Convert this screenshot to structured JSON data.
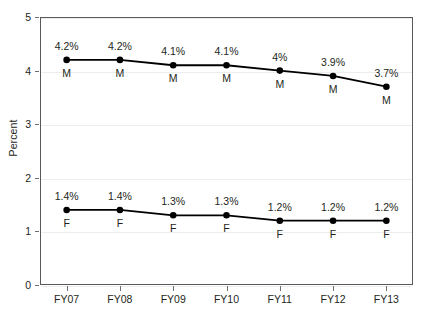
{
  "chart_data": {
    "type": "line",
    "title": "",
    "xlabel": "",
    "ylabel": "Percent",
    "categories": [
      "FY07",
      "FY08",
      "FY09",
      "FY10",
      "FY11",
      "FY12",
      "FY13"
    ],
    "ylim": [
      0,
      5
    ],
    "y_ticks": [
      "0",
      "1",
      "2",
      "3",
      "4",
      "5"
    ],
    "grid": true,
    "legend": "none",
    "marker_style": "filled-circle",
    "line_color": "#000000",
    "marker_color": "#000000",
    "gridline_color": "#ededee",
    "axis_color": "#58595b",
    "series": [
      {
        "name": "M",
        "letter": "M",
        "values": [
          4.2,
          4.2,
          4.1,
          4.1,
          4.0,
          3.9,
          3.7
        ],
        "labels": [
          "4.2%",
          "4.2%",
          "4.1%",
          "4.1%",
          "4%",
          "3.9%",
          "3.7%"
        ]
      },
      {
        "name": "F",
        "letter": "F",
        "values": [
          1.4,
          1.4,
          1.3,
          1.3,
          1.2,
          1.2,
          1.2
        ],
        "labels": [
          "1.4%",
          "1.4%",
          "1.3%",
          "1.3%",
          "1.2%",
          "1.2%",
          "1.2%"
        ]
      }
    ]
  }
}
